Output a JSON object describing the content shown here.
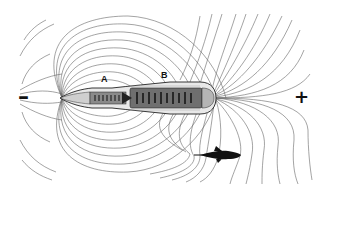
{
  "diagram": {
    "labels": {
      "region_a": "A",
      "region_b": "B"
    },
    "poles": {
      "negative": "–",
      "positive": "+"
    },
    "colors": {
      "field_lines": "#555555",
      "body_outline": "#222222",
      "organ_fill": "#8a8a8a",
      "prey": "#111111",
      "background": "#ffffff"
    }
  }
}
